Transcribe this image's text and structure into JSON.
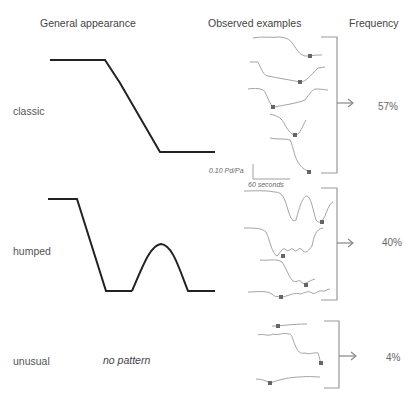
{
  "headers": {
    "general": "General appearance",
    "observed": "Observed examples",
    "frequency": "Frequency"
  },
  "rows": [
    {
      "label": "classic",
      "frequency": "57%",
      "example_count": 5
    },
    {
      "label": "humped",
      "frequency": "40%",
      "example_count": 4
    },
    {
      "label": "unusual",
      "frequency": "4%",
      "example_count": 3,
      "pattern_text": "no pattern"
    }
  ],
  "scale_bar": {
    "y_label": "0.10 Pd/Pa",
    "x_label": "60 seconds"
  },
  "colors": {
    "schematic_line": "#222222",
    "trace_line": "#999999",
    "marker": "#666666",
    "bracket": "#999999",
    "text": "#555555"
  }
}
